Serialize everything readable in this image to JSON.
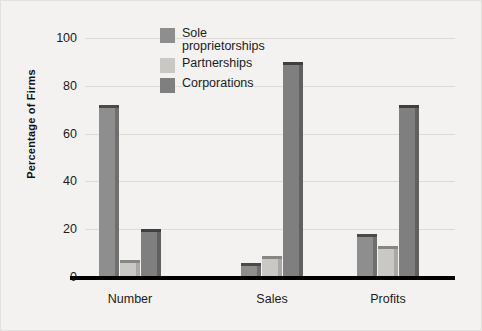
{
  "chart_data": {
    "type": "bar",
    "title": "",
    "xlabel": "",
    "ylabel": "Percentage of Firms",
    "categories": [
      "Number",
      "Sales",
      "Profits"
    ],
    "yticks": [
      0,
      20,
      40,
      60,
      80,
      100
    ],
    "ylim": [
      0,
      100
    ],
    "grid": true,
    "legend_position": "top-center",
    "series": [
      {
        "name": "Sole proprietorships",
        "values": [
          72,
          6,
          18
        ],
        "color": "#8e8e8e"
      },
      {
        "name": "Partnerships",
        "values": [
          7,
          9,
          13
        ],
        "color": "#c9c8c4"
      },
      {
        "name": "Corporations",
        "values": [
          20,
          90,
          72
        ],
        "color": "#7f7f7f"
      }
    ]
  },
  "legend": {
    "items": [
      {
        "label": "Sole proprietorships"
      },
      {
        "label": "Partnerships"
      },
      {
        "label": "Corporations"
      }
    ]
  },
  "axis": {
    "y_title": "Percentage of Firms",
    "y_tick_labels": [
      "0",
      "20",
      "40",
      "60",
      "80",
      "100"
    ],
    "x_tick_labels": [
      "Number",
      "Sales",
      "Profits"
    ]
  },
  "colors": {
    "background": "#f3f2f0",
    "gridline": "#dcdbd7",
    "axis_line": "#000000",
    "text": "#1b1b1b"
  }
}
